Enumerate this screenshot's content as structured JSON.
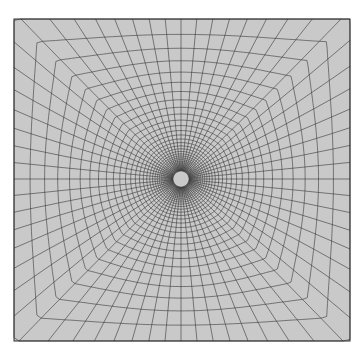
{
  "figure": {
    "type": "structured-mesh",
    "background": "#ffffff",
    "fill": "#c9c9c9",
    "line_color": "#2a2a2a",
    "domain": {
      "left": 14,
      "top": 19,
      "right": 350,
      "bottom": 341
    },
    "center": {
      "x": 181,
      "y": 179
    },
    "inner_radius": 8,
    "rings": 34,
    "grading": 1.11,
    "spokes": 64
  }
}
